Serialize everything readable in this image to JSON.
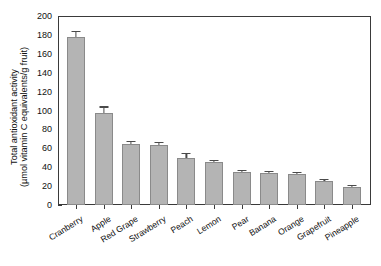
{
  "chart_data": {
    "type": "bar",
    "title": "",
    "subtitle": "",
    "xlabel": "",
    "ylabel": "Total antioxidant activity (µmol vitamin C equivalents/g fruit)",
    "ylabel_lines": [
      "Total antioxidant activity",
      "(µmol vitamin C equivalents/g fruit)"
    ],
    "ylim": [
      0,
      200
    ],
    "ytick_values": [
      0,
      20,
      40,
      60,
      80,
      100,
      120,
      140,
      160,
      180,
      200
    ],
    "ytick_labels": [
      "0",
      "20",
      "40",
      "60",
      "80",
      "100",
      "120",
      "140",
      "160",
      "180",
      "200"
    ],
    "grid": false,
    "legend": null,
    "bar_color": "#b4b4b4",
    "bar_edge_color": "#8a8a8a",
    "axis_color": "#3a3a3a",
    "error_bar_color": "#4a4a4a",
    "categories": [
      "Cranberry",
      "Apple",
      "Red Grape",
      "Strawberry",
      "Peach",
      "Lemon",
      "Pear",
      "Banana",
      "Orange",
      "Grapefruit",
      "Pineapple"
    ],
    "values": [
      178,
      97,
      65,
      64,
      50,
      45,
      35,
      34,
      33,
      25,
      19
    ],
    "errors": [
      5,
      6,
      1.5,
      1.5,
      4,
      1.5,
      1,
      1,
      1,
      1,
      0.8
    ],
    "series": [
      {
        "name": "Total antioxidant activity",
        "values": [
          178,
          97,
          65,
          64,
          50,
          45,
          35,
          34,
          33,
          25,
          19
        ]
      }
    ]
  }
}
